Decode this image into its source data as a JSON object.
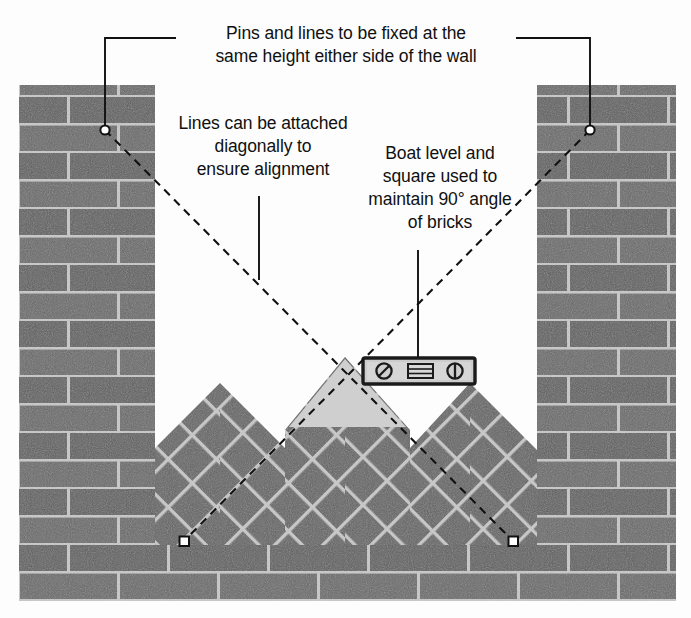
{
  "diagram": {
    "background_color": "#fdfdfd",
    "ink_color": "#101010"
  },
  "callouts": [
    {
      "id": "pins-and-lines",
      "text": "Pins and lines to be fixed at the\nsame height either side of the wall",
      "leader": "bracket-down-both-sides"
    },
    {
      "id": "diagonal-lines",
      "text": "Lines can be attached\ndiagonally to\nensure alignment",
      "leader": "vertical-down"
    },
    {
      "id": "boat-level",
      "text": "Boat level and\nsquare used to\nmaintain 90° angle\nof bricks",
      "leader": "vertical-down"
    }
  ],
  "wall": {
    "brick_face_color": "#666666",
    "brick_face_color_alt": "#5e5e5e",
    "mortar_color": "#c9c9c9",
    "course_height": 28,
    "brick_length": 100,
    "left_pier": {
      "x": 19,
      "y": 85,
      "w": 136,
      "h": 460
    },
    "right_pier": {
      "x": 537,
      "y": 85,
      "w": 139,
      "h": 460
    },
    "base_courses": {
      "x": 19,
      "y": 545,
      "w": 657,
      "h": 56
    },
    "chevron_field": {
      "description": "45-degree herringbone / chevron raking courses between the piers",
      "peaks": 3,
      "peak_x": [
        220,
        345,
        470
      ],
      "apex_y": [
        385,
        358,
        385
      ],
      "base_y": 545
    }
  },
  "boat_level": {
    "x": 363,
    "y": 358,
    "w": 112,
    "h": 26,
    "body_color": "#c6c6c6",
    "frame_color": "#1c1c1c",
    "vials": [
      {
        "name": "plumb-vial",
        "shape": "circle-with-diagonal-slash"
      },
      {
        "name": "level-vial",
        "shape": "rectangle-with-graduations"
      },
      {
        "name": "square-vial",
        "shape": "circle-with-vertical-line"
      }
    ]
  },
  "square_guide": {
    "description": "light triangular 90-degree square under the boat level",
    "fill_color": "#cccccc"
  },
  "pins": [
    {
      "name": "pin-top-left",
      "x": 105,
      "y": 130,
      "shape": "circle"
    },
    {
      "name": "pin-top-right",
      "x": 590,
      "y": 130,
      "shape": "circle"
    },
    {
      "name": "pin-bottom-left",
      "x": 184,
      "y": 541,
      "shape": "square"
    },
    {
      "name": "pin-bottom-right",
      "x": 513,
      "y": 541,
      "shape": "square"
    }
  ],
  "string_lines": [
    {
      "name": "line-left-diagonal",
      "from": "pin-top-left",
      "to": "pin-bottom-right",
      "style": "dashed"
    },
    {
      "name": "line-right-diagonal",
      "from": "pin-top-right",
      "to": "pin-bottom-left",
      "style": "dashed"
    }
  ]
}
